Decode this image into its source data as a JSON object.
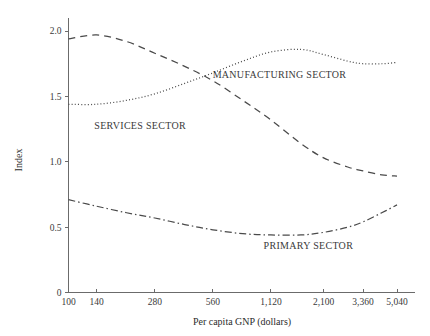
{
  "chart_data": {
    "type": "line",
    "title": "",
    "xlabel": "Per capita GNP (dollars)",
    "ylabel": "Index",
    "x_tick_labels": [
      "100",
      "140",
      "280",
      "560",
      "1,120",
      "2,100",
      "3,360",
      "5,040"
    ],
    "x_tick_values": [
      100,
      140,
      280,
      560,
      1120,
      2100,
      3360,
      5040
    ],
    "x_scale": "log",
    "xlim": [
      100,
      5040
    ],
    "y_tick_labels": [
      "0",
      "0.5",
      "1.0",
      "1.5",
      "2.0"
    ],
    "y_tick_values": [
      0,
      0.5,
      1.0,
      1.5,
      2.0
    ],
    "ylim": [
      0,
      2.1
    ],
    "grid": false,
    "legend_position": "inline-annotations",
    "series": [
      {
        "name": "MANUFACTURING SECTOR",
        "line_style": "dotted",
        "label_x": 1240,
        "label_y": 1.64,
        "x": [
          100,
          140,
          200,
          280,
          400,
          560,
          800,
          1120,
          1600,
          2100,
          2800,
          3360,
          4200,
          5040
        ],
        "values": [
          1.44,
          1.44,
          1.47,
          1.52,
          1.6,
          1.68,
          1.77,
          1.84,
          1.86,
          1.82,
          1.77,
          1.75,
          1.75,
          1.76
        ]
      },
      {
        "name": "SERVICES SECTOR",
        "line_style": "dashed",
        "label_x": 235,
        "label_y": 1.25,
        "x": [
          100,
          140,
          200,
          280,
          400,
          560,
          800,
          1120,
          1600,
          2100,
          2800,
          3360,
          4200,
          5040
        ],
        "values": [
          1.94,
          1.97,
          1.92,
          1.83,
          1.73,
          1.62,
          1.47,
          1.32,
          1.14,
          1.03,
          0.96,
          0.93,
          0.9,
          0.89
        ]
      },
      {
        "name": "PRIMARY SECTOR",
        "line_style": "dash-dot",
        "label_x": 1750,
        "label_y": 0.33,
        "x": [
          100,
          140,
          200,
          280,
          400,
          560,
          800,
          1120,
          1600,
          2100,
          2800,
          3360,
          4200,
          5040
        ],
        "values": [
          0.71,
          0.66,
          0.61,
          0.57,
          0.52,
          0.48,
          0.45,
          0.44,
          0.44,
          0.46,
          0.5,
          0.54,
          0.61,
          0.67
        ]
      }
    ]
  },
  "axes": {
    "y_axis_title": "Index",
    "x_axis_title": "Per capita GNP (dollars)"
  }
}
